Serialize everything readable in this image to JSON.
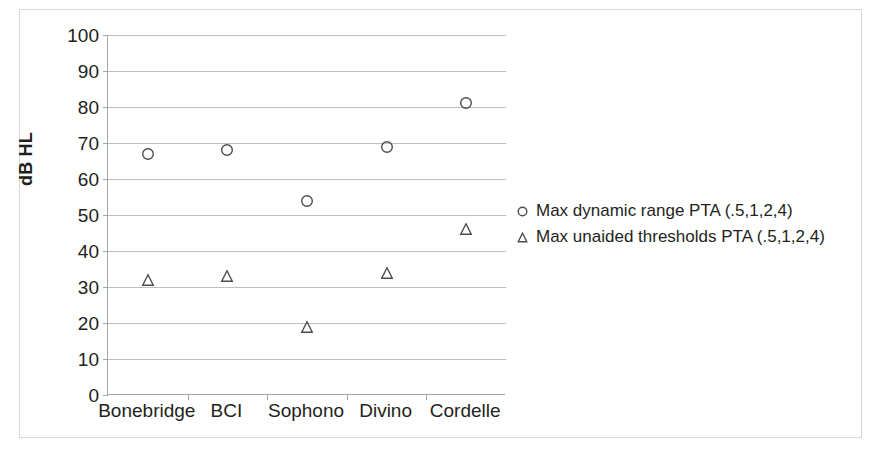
{
  "chart_data": {
    "type": "scatter",
    "title": "",
    "xlabel": "",
    "ylabel": "dB HL",
    "categories": [
      "Bonebridge",
      "BCI",
      "Sophono",
      "Divino",
      "Cordelle"
    ],
    "ylim": [
      0,
      100
    ],
    "ytick_step": 10,
    "yticks": [
      100,
      90,
      80,
      70,
      60,
      50,
      40,
      30,
      20,
      10,
      0
    ],
    "grid": "horizontal",
    "legend_position": "right-outside",
    "series": [
      {
        "name": "Max dynamic range PTA (.5,1,2,4)",
        "marker": "circle-open",
        "values": [
          67,
          68,
          54,
          69,
          81
        ]
      },
      {
        "name": "Max unaided thresholds PTA (.5,1,2,4)",
        "marker": "triangle-open",
        "values": [
          32,
          33,
          19,
          34,
          46
        ]
      }
    ]
  },
  "colors": {
    "marker_stroke": "#4d4d4d",
    "gridline": "#bfbfbf",
    "axis": "#a6a6a6",
    "text": "#231f20",
    "frame": "#d8d8d8",
    "background": "#ffffff"
  }
}
